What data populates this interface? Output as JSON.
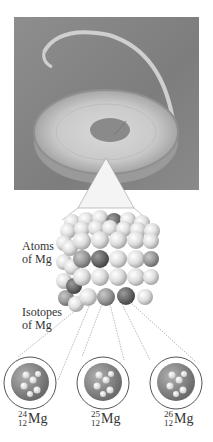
{
  "figure": {
    "photo_subject": "magnesium ribbon coil",
    "labels": {
      "atoms": [
        "Atoms",
        "of Mg"
      ],
      "isotopes": [
        "Isotopes",
        "of Mg"
      ]
    },
    "isotopes": [
      {
        "mass": "24",
        "atomic": "12",
        "symbol": "Mg"
      },
      {
        "mass": "25",
        "atomic": "12",
        "symbol": "Mg"
      },
      {
        "mass": "26",
        "atomic": "12",
        "symbol": "Mg"
      }
    ],
    "colors": {
      "photo_bg": "#858585",
      "sphere_light": "#e6e6e6",
      "sphere_dark": "#6a6a6a",
      "nucleus": "#8c8c8c",
      "outline": "#555555"
    }
  }
}
